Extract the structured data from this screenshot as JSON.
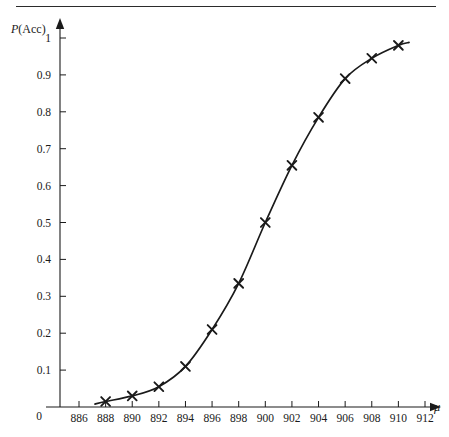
{
  "page": {
    "background_color": "#ffffff",
    "rule_color": "#2b2b2b",
    "ink_color": "#1a1a1a"
  },
  "chart_data": {
    "type": "line",
    "title": "",
    "subtitle": "",
    "xlabel": "μ",
    "ylabel": "P(Acc)",
    "grid": false,
    "legend": "none",
    "marker": "x",
    "origin_label": "0",
    "xlim": [
      885,
      913
    ],
    "ylim": [
      0,
      1.02
    ],
    "xticks": [
      886,
      888,
      890,
      892,
      894,
      896,
      898,
      900,
      902,
      904,
      906,
      908,
      910,
      912
    ],
    "xtick_labels": [
      "886",
      "888",
      "890",
      "892",
      "894",
      "896",
      "898",
      "900",
      "902",
      "904",
      "906",
      "908",
      "910",
      "912"
    ],
    "yticks": [
      0,
      0.1,
      0.2,
      0.3,
      0.4,
      0.5,
      0.6,
      0.7,
      0.8,
      0.9,
      1
    ],
    "ytick_labels": [
      "0",
      "0.1",
      "0.2",
      "0.3",
      "0.4",
      "0.5",
      "0.6",
      "0.7",
      "0.8",
      "0.9",
      "1"
    ],
    "x": [
      888,
      890,
      892,
      894,
      896,
      898,
      900,
      902,
      904,
      906,
      908,
      910
    ],
    "values": [
      0.015,
      0.03,
      0.055,
      0.11,
      0.21,
      0.335,
      0.5,
      0.655,
      0.785,
      0.89,
      0.945,
      0.98
    ],
    "series": [
      {
        "name": "P(Acc)",
        "x": [
          888,
          890,
          892,
          894,
          896,
          898,
          900,
          902,
          904,
          906,
          908,
          910
        ],
        "values": [
          0.015,
          0.03,
          0.055,
          0.11,
          0.21,
          0.335,
          0.5,
          0.655,
          0.785,
          0.89,
          0.945,
          0.98
        ]
      }
    ],
    "annotations": []
  }
}
